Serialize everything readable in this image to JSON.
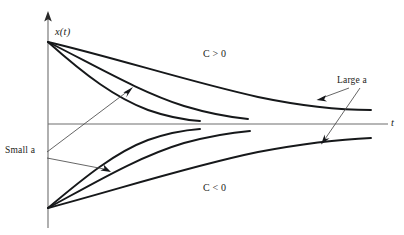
{
  "figure": {
    "background_color": "#ffffff",
    "curve_color": "#16181a",
    "axis_color": "#6e6e6e",
    "label_color": "#1b1d20"
  },
  "axes": {
    "vertical": {
      "name": "x(t)",
      "label": "x(t)",
      "x_px": 48,
      "top_px": 12,
      "bottom_px": 228,
      "arrow": "up"
    },
    "horizontal": {
      "name": "t",
      "label": "t",
      "y_px": 124,
      "left_px": 48,
      "right_px": 388,
      "arrow": "none"
    },
    "origin_px": [
      48,
      124
    ]
  },
  "labels": {
    "y_axis": "x(t)",
    "x_axis": "t",
    "upper_region": "C > 0",
    "lower_region": "C < 0",
    "large_a": "Large a",
    "small_a": "Small a"
  },
  "annotations": [
    {
      "name": "large-a",
      "text": "Large a",
      "text_px": [
        337,
        76
      ],
      "targets": [
        [
          317,
          99
        ],
        [
          322,
          141
        ]
      ],
      "description": "Points to the two outermost slowly-decaying curves"
    },
    {
      "name": "small-a",
      "text": "Small a",
      "text_px": [
        5,
        146
      ],
      "targets": [
        [
          122,
          86
        ],
        [
          110,
          172
        ]
      ],
      "description": "Points to the two innermost rapidly-decaying curves"
    }
  ],
  "chart_data": {
    "type": "line",
    "title": "",
    "xlabel": "t",
    "ylabel": "x(t)",
    "grid": false,
    "legend": "none",
    "axis_origin": [
      48,
      124
    ],
    "series": [
      {
        "name": "C>0 fast decay (small a label target, innermost)",
        "sign": "positive",
        "decay": "fast",
        "path": "M 48 42 C 86 76, 116 98, 148 110 C 168 117, 186 120, 200 121",
        "end_px": [
          200,
          121
        ]
      },
      {
        "name": "C>0 medium decay",
        "sign": "positive",
        "decay": "medium",
        "path": "M 48 42 C 96 66, 140 92, 184 106 C 214 115, 238 118, 248 119",
        "end_px": [
          248,
          119
        ]
      },
      {
        "name": "C>0 slow decay (large a label target, outermost)",
        "sign": "positive",
        "decay": "slow",
        "path": "M 48 42 C 116 58, 190 82, 258 97 C 306 107, 348 110, 371 110",
        "end_px": [
          371,
          110
        ]
      },
      {
        "name": "C<0 fast decay (small a label target, innermost)",
        "sign": "negative",
        "decay": "fast",
        "path": "M 48 208 C 86 176, 116 152, 148 140 C 168 133, 186 130, 200 129",
        "end_px": [
          200,
          129
        ]
      },
      {
        "name": "C<0 medium decay",
        "sign": "negative",
        "decay": "medium",
        "path": "M 48 208 C 96 182, 140 156, 184 143 C 214 135, 238 132, 250 131",
        "end_px": [
          250,
          131
        ]
      },
      {
        "name": "C<0 slow decay (large a label target, outermost)",
        "sign": "negative",
        "decay": "slow",
        "path": "M 48 208 C 116 190, 190 166, 258 152 C 306 143, 348 139, 371 138",
        "end_px": [
          371,
          138
        ]
      }
    ]
  }
}
